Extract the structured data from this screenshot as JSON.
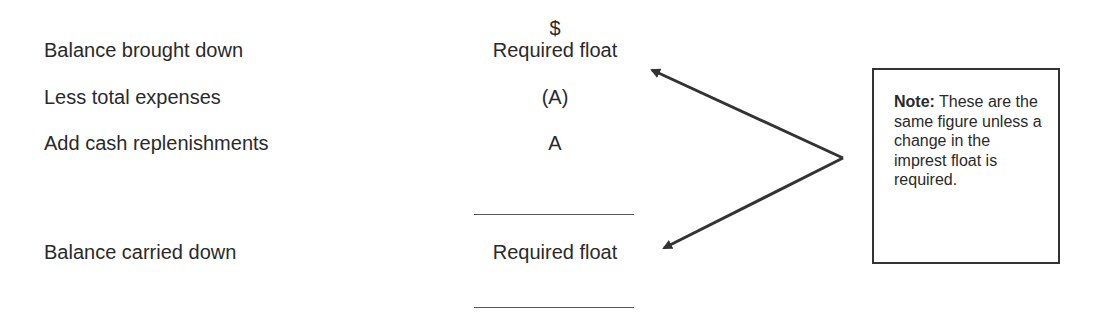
{
  "statement": {
    "currency_header": "$",
    "rows": [
      {
        "label": "Balance brought down",
        "value": "Required float"
      },
      {
        "label": "Less total expenses",
        "value": "(A)"
      },
      {
        "label": "Add cash replenishments",
        "value": "A"
      },
      {
        "label": "Balance carried down",
        "value": "Required float"
      }
    ]
  },
  "note": {
    "title": "Note:",
    "text": " These are the same figure unless a change in the imprest float is required."
  },
  "colors": {
    "text": "#2a2a2a",
    "lines": "#333333"
  }
}
